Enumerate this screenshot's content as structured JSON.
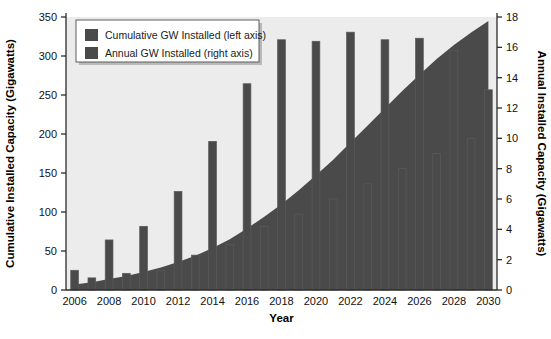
{
  "chart_data": {
    "type": "bar",
    "title": "",
    "xlabel": "Year",
    "ylabel": "Cumulative Installed Capacity (Gigawatts)",
    "y2label": "Annual Installed Capacity (Gigawatts)",
    "grid": false,
    "legend_position": "top-left",
    "xlim": [
      2005.5,
      2030.5
    ],
    "ylim": [
      0,
      350
    ],
    "y2lim": [
      0,
      18
    ],
    "yticks": [
      0,
      50,
      100,
      150,
      200,
      250,
      300,
      350
    ],
    "y2ticks": [
      0,
      2,
      4,
      6,
      8,
      10,
      12,
      14,
      16,
      18
    ],
    "xticks": [
      2006,
      2008,
      2010,
      2012,
      2014,
      2016,
      2018,
      2020,
      2022,
      2024,
      2026,
      2028,
      2030
    ],
    "x": [
      2006,
      2007,
      2008,
      2009,
      2010,
      2011,
      2012,
      2013,
      2014,
      2015,
      2016,
      2017,
      2018,
      2019,
      2020,
      2021,
      2022,
      2023,
      2024,
      2025,
      2026,
      2027,
      2028,
      2029,
      2030
    ],
    "series": [
      {
        "name": "Cumulative GW Installed (left axis)",
        "axis": "left",
        "render": "area",
        "unit": "GW",
        "values": [
          7,
          10,
          14,
          18,
          23,
          29,
          36,
          44,
          54,
          65,
          79,
          94,
          110,
          128,
          147,
          167,
          189,
          211,
          233,
          255,
          276,
          296,
          314,
          330,
          345
        ]
      },
      {
        "name": "Annual GW Installed (right axis)",
        "axis": "right",
        "render": "bar",
        "unit": "GW",
        "values": [
          1.3,
          0.8,
          3.3,
          1.1,
          4.2,
          1.3,
          6.5,
          2.3,
          9.8,
          3.0,
          13.6,
          4.2,
          16.5,
          5.0,
          16.4,
          6.0,
          17.0,
          7.0,
          16.5,
          8.0,
          16.6,
          9.0,
          15.8,
          10.0,
          13.2
        ]
      }
    ],
    "colors": {
      "series_fill": "#4a4a4a",
      "plot_background": "#ececed",
      "axis": "#2b2b2b",
      "text": "#111111"
    }
  },
  "legend": {
    "entries": [
      {
        "label": "Cumulative GW Installed (left axis)",
        "swatch": "#4a4a4a"
      },
      {
        "label": "Annual GW Installed (right axis)",
        "swatch": "#4a4a4a"
      }
    ]
  },
  "axes": {
    "x_title": "Year",
    "y_left_title": "Cumulative Installed Capacity (Gigawatts)",
    "y_right_title": "Annual Installed Capacity (Gigawatts)"
  }
}
